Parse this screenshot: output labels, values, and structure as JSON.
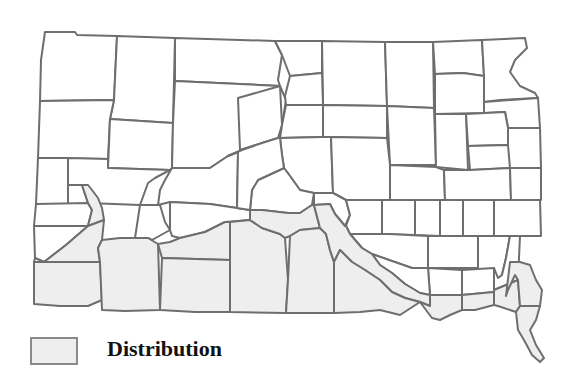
{
  "map": {
    "title": "South Dakota county distribution map",
    "region": "South Dakota",
    "colors": {
      "background": "#ffffff",
      "county_fill": "#ffffff",
      "distribution_fill": "#eeeeee",
      "border": "#6e6e6e"
    },
    "counties": [
      {
        "id": "c1",
        "shaded": false
      },
      {
        "id": "c2",
        "shaded": false
      },
      {
        "id": "c3",
        "shaded": false
      },
      {
        "id": "c4",
        "shaded": false
      },
      {
        "id": "c5",
        "shaded": false
      },
      {
        "id": "c6",
        "shaded": false
      },
      {
        "id": "c7",
        "shaded": false
      },
      {
        "id": "c8",
        "shaded": false
      },
      {
        "id": "c9",
        "shaded": false
      },
      {
        "id": "c10",
        "shaded": false
      },
      {
        "id": "c11",
        "shaded": false
      },
      {
        "id": "c12",
        "shaded": false
      },
      {
        "id": "c13",
        "shaded": false
      },
      {
        "id": "c14",
        "shaded": false
      },
      {
        "id": "c15",
        "shaded": false
      },
      {
        "id": "c16",
        "shaded": false
      },
      {
        "id": "c17",
        "shaded": false
      },
      {
        "id": "c18",
        "shaded": false
      },
      {
        "id": "c19",
        "shaded": false
      },
      {
        "id": "c20",
        "shaded": false
      },
      {
        "id": "c21",
        "shaded": false
      },
      {
        "id": "c22",
        "shaded": false
      },
      {
        "id": "c23",
        "shaded": false
      },
      {
        "id": "c24",
        "shaded": false
      },
      {
        "id": "c25",
        "shaded": false
      },
      {
        "id": "c26",
        "shaded": false
      },
      {
        "id": "c27",
        "shaded": false
      },
      {
        "id": "c28",
        "shaded": false
      },
      {
        "id": "c29",
        "shaded": false
      },
      {
        "id": "c30",
        "shaded": false
      },
      {
        "id": "c31",
        "shaded": false
      },
      {
        "id": "c32",
        "shaded": false
      },
      {
        "id": "c33",
        "shaded": false
      },
      {
        "id": "c34",
        "shaded": false
      },
      {
        "id": "c35",
        "shaded": false
      },
      {
        "id": "c36",
        "shaded": false
      },
      {
        "id": "c37",
        "shaded": false
      },
      {
        "id": "c38",
        "shaded": false
      },
      {
        "id": "c39",
        "shaded": false
      },
      {
        "id": "c40",
        "shaded": false
      },
      {
        "id": "c41",
        "shaded": false
      },
      {
        "id": "c42",
        "shaded": false
      },
      {
        "id": "c43",
        "shaded": false
      },
      {
        "id": "c44",
        "shaded": false
      },
      {
        "id": "c45",
        "shaded": false
      },
      {
        "id": "c46",
        "shaded": false
      },
      {
        "id": "c47",
        "shaded": false
      },
      {
        "id": "c48",
        "shaded": false
      },
      {
        "id": "c49",
        "shaded": false
      },
      {
        "id": "c50",
        "shaded": false
      },
      {
        "id": "c51",
        "shaded": false
      },
      {
        "id": "s1",
        "shaded": true
      },
      {
        "id": "s2",
        "shaded": true
      },
      {
        "id": "s3",
        "shaded": true
      },
      {
        "id": "s4",
        "shaded": true
      },
      {
        "id": "s5",
        "shaded": true
      },
      {
        "id": "s6",
        "shaded": true
      },
      {
        "id": "s7",
        "shaded": true
      },
      {
        "id": "s8",
        "shaded": true
      },
      {
        "id": "s9",
        "shaded": true
      },
      {
        "id": "s10",
        "shaded": true
      },
      {
        "id": "s11",
        "shaded": true
      },
      {
        "id": "s12",
        "shaded": true
      },
      {
        "id": "s13",
        "shaded": true
      },
      {
        "id": "s14",
        "shaded": true
      },
      {
        "id": "s15",
        "shaded": true
      },
      {
        "id": "s16",
        "shaded": true
      }
    ]
  },
  "legend": {
    "items": [
      {
        "label": "Distribution",
        "color": "#eeeeee"
      }
    ]
  }
}
